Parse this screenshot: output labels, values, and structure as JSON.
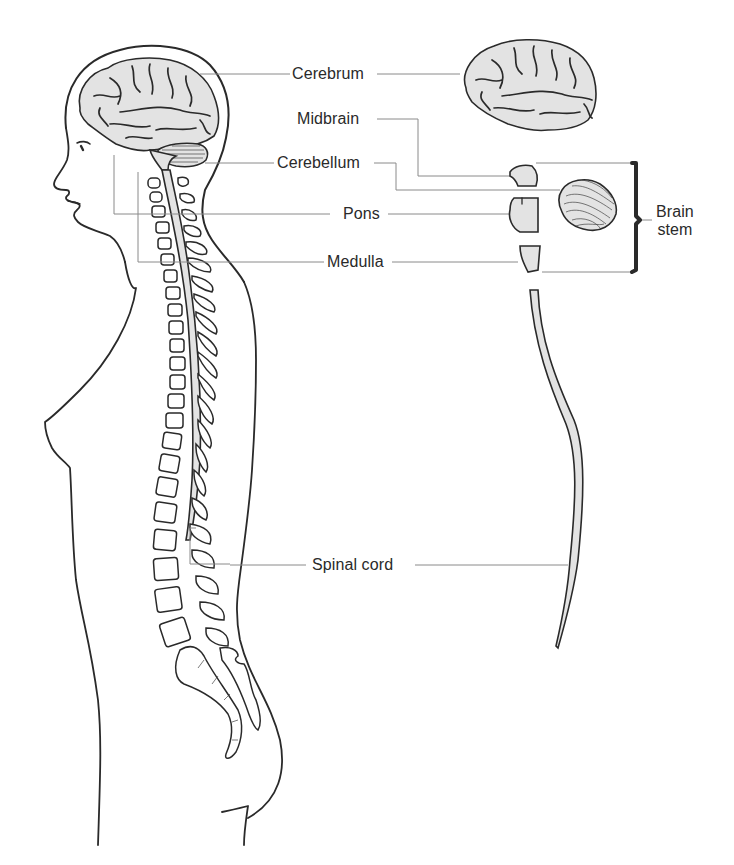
{
  "figure": {
    "type": "anatomical-diagram",
    "colors": {
      "ink": "#2a2a2a",
      "leader_line": "#8a8a8a",
      "tissue_fill": "#e3e3e3",
      "background": "#ffffff"
    }
  },
  "labels": {
    "cerebrum": "Cerebrum",
    "midbrain": "Midbrain",
    "cerebellum": "Cerebellum",
    "pons": "Pons",
    "medulla": "Medulla",
    "spinal_cord": "Spinal cord",
    "brain_stem_line1": "Brain",
    "brain_stem_line2": "stem"
  },
  "parts": [
    {
      "id": "cerebrum",
      "label": "Cerebrum",
      "group": "brain"
    },
    {
      "id": "midbrain",
      "label": "Midbrain",
      "group": "brain stem"
    },
    {
      "id": "cerebellum",
      "label": "Cerebellum",
      "group": "brain"
    },
    {
      "id": "pons",
      "label": "Pons",
      "group": "brain stem"
    },
    {
      "id": "medulla",
      "label": "Medulla",
      "group": "brain stem"
    },
    {
      "id": "spinal_cord",
      "label": "Spinal cord",
      "group": "spinal"
    }
  ],
  "bracket": {
    "label": "Brain stem",
    "groups": [
      "Midbrain",
      "Pons",
      "Medulla"
    ]
  }
}
